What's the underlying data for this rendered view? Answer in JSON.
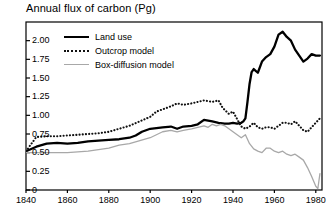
{
  "chart_data": {
    "type": "line",
    "title": "Annual flux of carbon (Pg)",
    "xlabel": "",
    "ylabel": "",
    "xlim": [
      1840,
      1983
    ],
    "ylim": [
      0,
      2.25
    ],
    "grid": false,
    "legend_position": "top-left-inside",
    "xticks": [
      1840,
      1860,
      1880,
      1900,
      1920,
      1940,
      1960,
      1980
    ],
    "xtick_labels": [
      "1840",
      "1860",
      "1880",
      "1900",
      "1920",
      "1940",
      "1960",
      "1980"
    ],
    "yticks": [
      0,
      0.25,
      0.5,
      0.75,
      1.0,
      1.25,
      1.5,
      1.75,
      2.0
    ],
    "ytick_labels": [
      "0",
      "0.25",
      "0.50",
      "0.75",
      "1.00",
      "1.25",
      "1.50",
      "1.75",
      "2.00"
    ],
    "series": [
      {
        "name": "Land use",
        "style": "solid",
        "color": "#000000",
        "x": [
          1840,
          1845,
          1850,
          1855,
          1860,
          1865,
          1870,
          1875,
          1880,
          1885,
          1890,
          1893,
          1896,
          1900,
          1903,
          1906,
          1910,
          1913,
          1916,
          1920,
          1923,
          1926,
          1930,
          1933,
          1936,
          1938,
          1940,
          1942,
          1944,
          1945,
          1946,
          1947,
          1948,
          1949,
          1950,
          1952,
          1954,
          1956,
          1958,
          1960,
          1962,
          1964,
          1966,
          1968,
          1970,
          1972,
          1974,
          1976,
          1978,
          1980,
          1982
        ],
        "y": [
          0.52,
          0.58,
          0.62,
          0.63,
          0.62,
          0.63,
          0.65,
          0.66,
          0.67,
          0.68,
          0.7,
          0.73,
          0.78,
          0.82,
          0.83,
          0.84,
          0.85,
          0.82,
          0.85,
          0.86,
          0.88,
          0.94,
          0.92,
          0.9,
          0.89,
          0.89,
          0.9,
          0.89,
          0.9,
          0.92,
          0.96,
          1.18,
          1.42,
          1.58,
          1.62,
          1.57,
          1.72,
          1.78,
          1.82,
          1.92,
          2.08,
          2.12,
          2.05,
          2.0,
          1.88,
          1.8,
          1.72,
          1.76,
          1.82,
          1.8,
          1.8
        ]
      },
      {
        "name": "Outcrop model",
        "style": "dotted",
        "color": "#111111",
        "x": [
          1840,
          1845,
          1850,
          1855,
          1860,
          1865,
          1870,
          1875,
          1880,
          1885,
          1890,
          1895,
          1900,
          1903,
          1906,
          1910,
          1913,
          1916,
          1920,
          1923,
          1926,
          1930,
          1933,
          1935,
          1938,
          1940,
          1942,
          1944,
          1946,
          1948,
          1950,
          1952,
          1954,
          1956,
          1958,
          1960,
          1962,
          1964,
          1966,
          1968,
          1970,
          1972,
          1974,
          1976,
          1978,
          1980,
          1982
        ],
        "y": [
          0.52,
          0.71,
          0.72,
          0.72,
          0.73,
          0.74,
          0.75,
          0.76,
          0.78,
          0.82,
          0.86,
          0.92,
          0.98,
          1.05,
          1.08,
          1.12,
          1.16,
          1.14,
          1.16,
          1.18,
          1.2,
          1.18,
          1.2,
          1.1,
          1.02,
          1.05,
          0.95,
          0.85,
          0.82,
          0.85,
          0.9,
          0.84,
          0.82,
          0.84,
          0.84,
          0.82,
          0.86,
          0.9,
          0.9,
          0.88,
          0.92,
          0.86,
          0.8,
          0.78,
          0.84,
          0.9,
          0.96
        ]
      },
      {
        "name": "Box-diffusion model",
        "style": "solid-gray",
        "color": "#a8a8a8",
        "x": [
          1840,
          1845,
          1850,
          1855,
          1860,
          1865,
          1870,
          1875,
          1880,
          1885,
          1890,
          1895,
          1900,
          1903,
          1906,
          1910,
          1913,
          1916,
          1920,
          1923,
          1926,
          1928,
          1930,
          1932,
          1934,
          1936,
          1938,
          1940,
          1942,
          1944,
          1946,
          1948,
          1950,
          1952,
          1954,
          1956,
          1958,
          1960,
          1962,
          1964,
          1966,
          1968,
          1970,
          1972,
          1974,
          1976,
          1978,
          1980,
          1981,
          1982
        ],
        "y": [
          0.5,
          0.5,
          0.5,
          0.5,
          0.5,
          0.51,
          0.52,
          0.54,
          0.56,
          0.6,
          0.62,
          0.66,
          0.7,
          0.74,
          0.78,
          0.8,
          0.78,
          0.8,
          0.82,
          0.84,
          0.86,
          0.84,
          0.88,
          0.86,
          0.88,
          0.86,
          0.82,
          0.78,
          0.74,
          0.7,
          0.74,
          0.62,
          0.55,
          0.52,
          0.5,
          0.56,
          0.56,
          0.52,
          0.5,
          0.52,
          0.48,
          0.46,
          0.48,
          0.44,
          0.4,
          0.3,
          0.18,
          0.05,
          0.02,
          0.22
        ]
      }
    ]
  },
  "legend": {
    "items": [
      {
        "label": "Land use",
        "style": "solid"
      },
      {
        "label": "Outcrop model",
        "style": "dotted"
      },
      {
        "label": "Box-diffusion model",
        "style": "solid-gray"
      }
    ]
  },
  "colors": {
    "axis": "#000000",
    "land_use": "#000000",
    "outcrop": "#111111",
    "box_diffusion": "#a8a8a8",
    "background": "#ffffff"
  }
}
